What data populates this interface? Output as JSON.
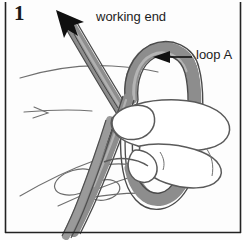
{
  "figure": {
    "step_number": "1",
    "colors": {
      "rope_fill": "#8d8d8d",
      "rope_fill_light": "#a5a5a5",
      "rope_outline": "#4a4a4a",
      "hand_outline": "#5a5a5a",
      "hand_fill": "#ffffff",
      "border": "#222222",
      "arrow": "#101010",
      "text": "#1c1c1c",
      "background": "#fdfdfd"
    }
  },
  "labels": {
    "working_end": "working end",
    "loop_a": "loop A"
  },
  "icons": {
    "working_end_arrow": "arrow-up-left-icon",
    "loop_a_arrow": "arrow-left-icon"
  },
  "borders": {
    "left_line": "vertical-rule",
    "right_line": "vertical-rule",
    "bottom_line": "horizontal-rule"
  }
}
